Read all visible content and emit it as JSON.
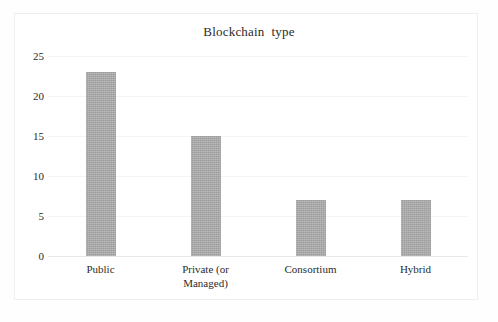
{
  "chart_data": {
    "type": "bar",
    "title": "Blockchain  type",
    "subtitle": "",
    "xlabel": "",
    "ylabel": "",
    "categories": [
      "Public",
      "Private (or Managed)",
      "Consortium",
      "Hybrid"
    ],
    "category_lines": [
      [
        "Public"
      ],
      [
        "Private (or",
        "Managed)"
      ],
      [
        "Consortium"
      ],
      [
        "Hybrid"
      ]
    ],
    "values": [
      23,
      15,
      7,
      7
    ],
    "ylim": [
      0,
      25
    ],
    "yticks": [
      0,
      5,
      10,
      15,
      20,
      25
    ],
    "ytick_labels": [
      "0",
      "5",
      "10",
      "15",
      "20",
      "25"
    ],
    "grid": true,
    "legend": false,
    "legend_position": "none",
    "bar_color": "#a9a9a9",
    "grid_color": "#f4f4f4",
    "axis_color": "#e8e8e8",
    "text_color": "#2b2b2b",
    "background_color": "#ffffff"
  }
}
